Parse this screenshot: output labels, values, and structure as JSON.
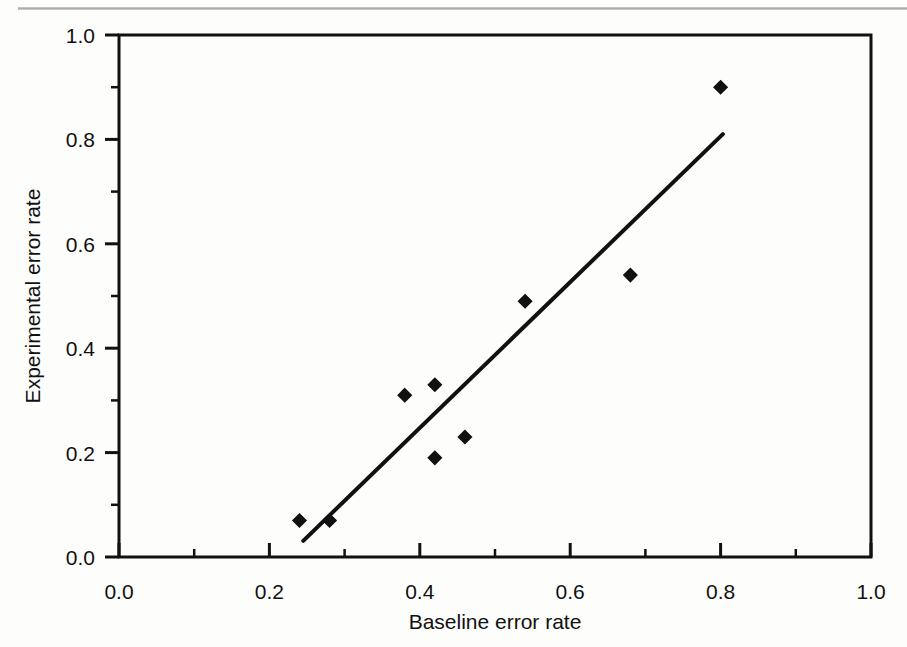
{
  "figure": {
    "background_color": "#fdfdfc",
    "ink_color": "#111111",
    "top_rule_color": "#9a9a9a"
  },
  "chart_data": {
    "type": "scatter",
    "title": "",
    "xlabel": "Baseline error rate",
    "ylabel": "Experimental error rate",
    "xlim": [
      0.0,
      1.0
    ],
    "ylim": [
      0.0,
      1.0
    ],
    "xticks": [
      0.0,
      0.2,
      0.4,
      0.6,
      0.8,
      1.0
    ],
    "yticks": [
      0.0,
      0.2,
      0.4,
      0.6,
      0.8,
      1.0
    ],
    "xtick_labels": [
      "0.0",
      "0.2",
      "0.4",
      "0.6",
      "0.8",
      "1.0"
    ],
    "ytick_labels": [
      "0.0",
      "0.2",
      "0.4",
      "0.6",
      "0.8",
      "1.0"
    ],
    "minor_xticks": [
      0.1,
      0.3,
      0.5,
      0.7,
      0.9
    ],
    "minor_yticks": [
      0.1,
      0.3,
      0.5,
      0.7,
      0.9
    ],
    "grid": false,
    "legend": null,
    "marker": "diamond",
    "marker_color": "#111111",
    "series": [
      {
        "name": "error rate comparison",
        "x": [
          0.24,
          0.28,
          0.38,
          0.42,
          0.42,
          0.46,
          0.54,
          0.68,
          0.8
        ],
        "y": [
          0.07,
          0.07,
          0.31,
          0.33,
          0.19,
          0.23,
          0.49,
          0.54,
          0.9
        ],
        "points": [
          {
            "x": 0.24,
            "y": 0.07
          },
          {
            "x": 0.28,
            "y": 0.07
          },
          {
            "x": 0.38,
            "y": 0.31
          },
          {
            "x": 0.42,
            "y": 0.33
          },
          {
            "x": 0.42,
            "y": 0.19
          },
          {
            "x": 0.46,
            "y": 0.23
          },
          {
            "x": 0.54,
            "y": 0.49
          },
          {
            "x": 0.68,
            "y": 0.54
          },
          {
            "x": 0.8,
            "y": 0.9
          }
        ]
      }
    ],
    "trendline": {
      "name": "fit line",
      "x0": 0.245,
      "y0": 0.031,
      "x1": 0.803,
      "y1": 0.81,
      "color": "#111111",
      "width": 4
    }
  }
}
